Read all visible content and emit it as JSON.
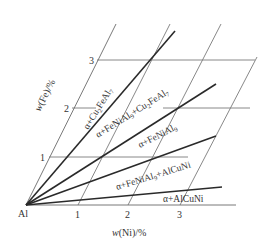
{
  "diagram": {
    "type": "ternary-section",
    "origin_label": "Al",
    "x_axis": {
      "label_prefix": "w",
      "label_elem": "(Ni)",
      "label_suffix": "/%",
      "ticks": [
        "1",
        "2",
        "3"
      ]
    },
    "y_axis": {
      "label_prefix": "w",
      "label_elem": "(Fe)",
      "label_suffix": "/%",
      "ticks": [
        "1",
        "2",
        "3"
      ]
    },
    "regions": [
      {
        "alpha": "α",
        "plus1": "+Cu",
        "sub1": "2",
        "p2": "FeAl",
        "sub2": "7"
      },
      {
        "alpha": "α",
        "plus1": "+FeNiAl",
        "sub1": "9",
        "p2": "+Cu",
        "sub2": "2",
        "p3": "FeAl",
        "sub3": "7"
      },
      {
        "alpha": "α",
        "plus1": "+FeNiAl",
        "sub1": "9"
      },
      {
        "alpha": "α",
        "plus1": "+FeNiAl",
        "sub1": "9",
        "p2": "+AlCuNi"
      },
      {
        "alpha": "α",
        "plus1": "+AlCuNi"
      }
    ]
  }
}
